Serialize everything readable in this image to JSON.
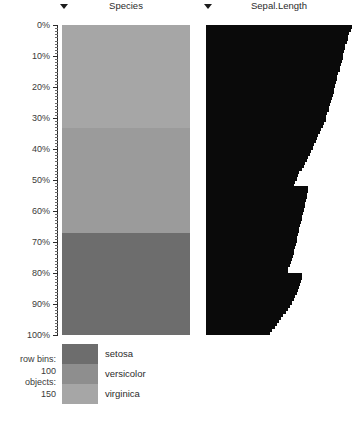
{
  "axis": {
    "name": "percentile-axis",
    "tick_labels": [
      "0%",
      "10%",
      "20%",
      "30%",
      "40%",
      "50%",
      "60%",
      "70%",
      "80%",
      "90%",
      "100%"
    ],
    "tick_values": [
      0,
      10,
      20,
      30,
      40,
      50,
      60,
      70,
      80,
      90,
      100
    ],
    "minor_tick_count": 100,
    "range": [
      0,
      100
    ],
    "unit": "%"
  },
  "columns": [
    {
      "name": "species-column",
      "title": "Species",
      "type": "categorical",
      "dropdown": "chevron-down-icon"
    },
    {
      "name": "sepal-length-column",
      "title": "Sepal.Length",
      "type": "numeric",
      "dropdown": "chevron-down-icon"
    }
  ],
  "legend": {
    "title": "",
    "items": [
      {
        "label": "setosa",
        "color": "#6d6d6d"
      },
      {
        "label": "versicolor",
        "color": "#8e8e8e"
      },
      {
        "label": "virginica",
        "color": "#a6a6a6"
      }
    ]
  },
  "stats": {
    "row_bins_label": "row bins:",
    "row_bins_value": "100",
    "objects_label": "objects:",
    "objects_value": "150"
  },
  "colors": {
    "bar": "#0a0a0a",
    "background": "#ffffff",
    "axis": "#2b2b2b",
    "text": "#3a3a3a"
  },
  "chart_data": {
    "type": "heatmap",
    "title": "",
    "xlabel": "",
    "ylabel": "",
    "ylim": [
      0,
      100
    ],
    "grid": false,
    "legend_position": "bottom",
    "series": [
      {
        "name": "Species",
        "type": "categorical-band",
        "bands": [
          {
            "label": "setosa",
            "start_pct": 0,
            "end_pct": 33.3,
            "color": "#a6a6a6"
          },
          {
            "label": "versicolor",
            "start_pct": 33.3,
            "end_pct": 67.0,
            "color": "#9b9b9b"
          },
          {
            "label": "virginica",
            "start_pct": 67.0,
            "end_pct": 100,
            "color": "#6d6d6d"
          }
        ]
      },
      {
        "name": "Sepal.Length",
        "type": "horizontal-bars",
        "bin_count": 100,
        "value_unit": "normalized",
        "values": [
          1.0,
          0.99,
          0.98,
          0.975,
          0.97,
          0.965,
          0.955,
          0.95,
          0.945,
          0.94,
          0.935,
          0.93,
          0.925,
          0.92,
          0.915,
          0.905,
          0.9,
          0.895,
          0.89,
          0.885,
          0.88,
          0.875,
          0.87,
          0.86,
          0.855,
          0.85,
          0.845,
          0.84,
          0.83,
          0.825,
          0.82,
          0.81,
          0.8,
          0.79,
          0.78,
          0.77,
          0.76,
          0.75,
          0.74,
          0.73,
          0.72,
          0.71,
          0.7,
          0.69,
          0.68,
          0.67,
          0.655,
          0.64,
          0.63,
          0.62,
          0.61,
          0.6,
          0.7,
          0.7,
          0.695,
          0.69,
          0.685,
          0.68,
          0.675,
          0.67,
          0.665,
          0.66,
          0.655,
          0.65,
          0.645,
          0.64,
          0.635,
          0.63,
          0.625,
          0.62,
          0.615,
          0.61,
          0.605,
          0.6,
          0.595,
          0.59,
          0.585,
          0.575,
          0.565,
          0.56,
          0.66,
          0.655,
          0.65,
          0.645,
          0.64,
          0.63,
          0.62,
          0.61,
          0.6,
          0.59,
          0.575,
          0.56,
          0.545,
          0.53,
          0.515,
          0.5,
          0.485,
          0.47,
          0.455,
          0.44
        ]
      }
    ]
  }
}
